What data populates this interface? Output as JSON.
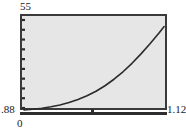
{
  "chart_data": {
    "type": "line",
    "title": "",
    "xlabel": "",
    "ylabel": "",
    "xlim": [
      0,
      1.12
    ],
    "ylim": [
      0.88,
      55
    ],
    "grid": false,
    "legend": null,
    "axis_labels": {
      "y_max": "55",
      "y_min": ".88",
      "x_min": "0",
      "x_max": "1.12"
    },
    "y_tick_count": 10,
    "x_tick_count": 1,
    "x_tick_positions": [
      0.56
    ],
    "series": [
      {
        "name": "curve",
        "color": "#2b2b2b",
        "x": [
          0.0,
          0.07,
          0.14,
          0.21,
          0.28,
          0.35,
          0.42,
          0.49,
          0.56,
          0.63,
          0.7,
          0.77,
          0.84,
          0.91,
          0.98,
          1.05,
          1.09
        ],
        "y": [
          0.88,
          1.3,
          1.95,
          2.85,
          4.0,
          5.45,
          7.3,
          9.6,
          12.4,
          15.8,
          19.8,
          24.4,
          29.6,
          35.4,
          41.6,
          48.2,
          52.2
        ]
      }
    ],
    "points_px": "2,94 12,91 22,88 32,84 42,80 52,76 62,71 72,65 82,59 92,52 102,44 112,36 122,28 132,20 142,13 147,10"
  },
  "colors": {
    "plot_background": "#e6e6e6",
    "frame": "#3a3a3a",
    "curve": "#2b2b2b",
    "text": "#1a1a1a",
    "page_background": "#ffffff"
  }
}
